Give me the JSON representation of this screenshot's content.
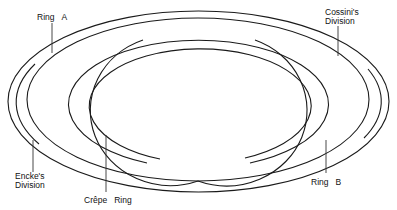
{
  "diagram": {
    "line_color": "#1a1a1a",
    "background": "#ffffff",
    "labels": {
      "ring_a": {
        "word1": "Ring",
        "word2": "A"
      },
      "cassini": {
        "line1": "Cossini's",
        "line2": "Division"
      },
      "encke": {
        "line1": "Encke's",
        "line2": "Division"
      },
      "crepe": {
        "word1": "Crêpe",
        "word2": "Ring"
      },
      "ring_b": {
        "word1": "Ring",
        "word2": "B"
      }
    }
  }
}
